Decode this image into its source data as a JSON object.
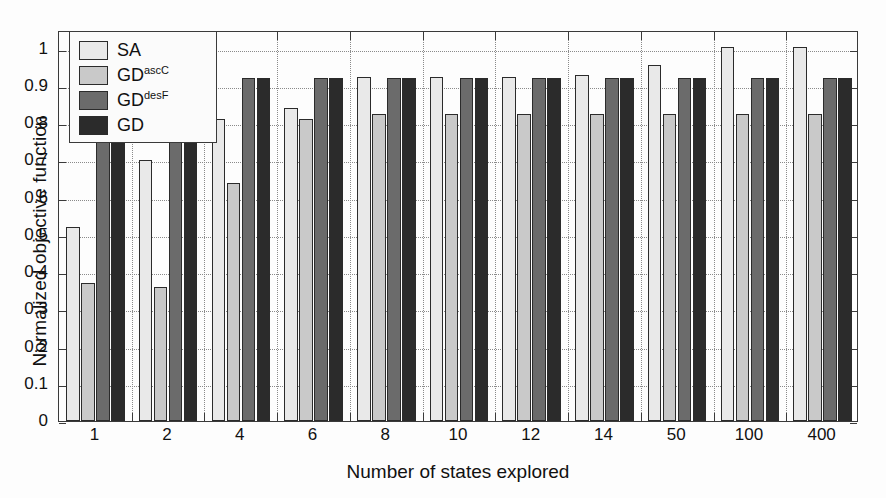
{
  "chart_data": {
    "type": "bar",
    "title": "",
    "xlabel": "Number of states explored",
    "ylabel": "Normalized objective function",
    "categories": [
      "1",
      "2",
      "4",
      "6",
      "8",
      "10",
      "12",
      "14",
      "50",
      "100",
      "400"
    ],
    "ylim": [
      0,
      1.05
    ],
    "yticks": [
      "0",
      "0.1",
      "0.2",
      "0.3",
      "0.4",
      "0.5",
      "0.6",
      "0.7",
      "0.8",
      "0.9",
      "1"
    ],
    "ytick_values": [
      0,
      0.1,
      0.2,
      0.3,
      0.4,
      0.5,
      0.6,
      0.7,
      0.8,
      0.9,
      1
    ],
    "grid": "horizontal-and-vertical-dotted",
    "legend_position": "upper-left-inside",
    "series": [
      {
        "name": "SA",
        "label_base": "SA",
        "label_sup": "",
        "color": "#e9e9e9",
        "values": [
          0.52,
          0.7,
          0.81,
          0.84,
          0.925,
          0.925,
          0.925,
          0.93,
          0.955,
          1.005,
          1.005
        ]
      },
      {
        "name": "GDascC",
        "label_base": "GD",
        "label_sup": "ascC",
        "color": "#c9c9c9",
        "values": [
          0.37,
          0.36,
          0.64,
          0.81,
          0.825,
          0.825,
          0.825,
          0.825,
          0.825,
          0.825,
          0.825
        ]
      },
      {
        "name": "GDdesF",
        "label_base": "GD",
        "label_sup": "desF",
        "color": "#6b6b6b",
        "values": [
          0.92,
          0.92,
          0.92,
          0.92,
          0.92,
          0.92,
          0.92,
          0.92,
          0.92,
          0.92,
          0.92
        ]
      },
      {
        "name": "GD",
        "label_base": "GD",
        "label_sup": "",
        "color": "#2b2b2b",
        "values": [
          0.92,
          0.92,
          0.92,
          0.92,
          0.92,
          0.92,
          0.92,
          0.92,
          0.92,
          0.92,
          0.92
        ]
      }
    ]
  },
  "axes": {
    "frame_color": "#3a3a3a",
    "grid_color": "#8a8a8a",
    "background": "#fdfdfd"
  }
}
